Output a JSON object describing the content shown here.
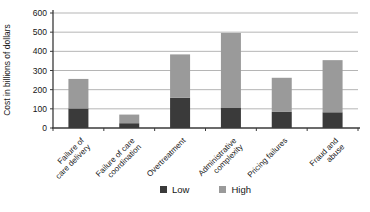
{
  "chart_data": {
    "type": "bar",
    "stacked": true,
    "title": "",
    "ylabel": "Cost in billions of dollars",
    "xlabel": "",
    "ylim": [
      0,
      600
    ],
    "yticks": [
      0,
      100,
      200,
      300,
      400,
      500,
      600
    ],
    "grid": true,
    "legend_position": "bottom",
    "categories": [
      "Failure of care delivery",
      "Failure of care coordination",
      "Overtreatment",
      "Administrative complexity",
      "Pricing failures",
      "Fraud and abuse"
    ],
    "category_label_lines": [
      [
        "Failure of",
        "care delivery"
      ],
      [
        "Failure of care",
        "coordination"
      ],
      [
        "Overtreatment"
      ],
      [
        "Administrative",
        "complexity"
      ],
      [
        "Pricing failures"
      ],
      [
        "Fraud and",
        "abuse"
      ]
    ],
    "series": [
      {
        "name": "Low",
        "color": "#3a3a3a",
        "values": [
          102,
          25,
          158,
          107,
          84,
          82
        ]
      },
      {
        "name": "High",
        "color": "#9a9a9a",
        "values": [
          154,
          45,
          226,
          389,
          178,
          272
        ]
      }
    ],
    "stacked_totals": [
      256,
      70,
      384,
      496,
      262,
      354
    ],
    "colors": {
      "gridline": "#b5b5b5",
      "axis": "#3a3a3a",
      "text": "#161616",
      "background": "#ffffff"
    }
  }
}
